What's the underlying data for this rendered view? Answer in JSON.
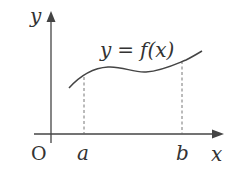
{
  "diagram": {
    "type": "function-graph",
    "colors": {
      "stroke": "#444444",
      "text": "#333333",
      "background": "#ffffff"
    },
    "axes": {
      "x_label": "x",
      "y_label": "y",
      "origin_label": "O"
    },
    "curve": {
      "label_lhs": "y",
      "label_eq": "=",
      "label_rhs": "f(x)",
      "label": "y = f(x)"
    },
    "markers": [
      {
        "label": "a"
      },
      {
        "label": "b"
      }
    ]
  }
}
